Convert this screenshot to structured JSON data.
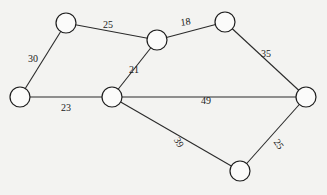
{
  "graph": {
    "type": "weighted-undirected-graph",
    "node_radius": 10,
    "nodes": [
      {
        "id": "A",
        "x": 66,
        "y": 23
      },
      {
        "id": "B",
        "x": 157,
        "y": 40
      },
      {
        "id": "C",
        "x": 225,
        "y": 22
      },
      {
        "id": "D",
        "x": 20,
        "y": 97
      },
      {
        "id": "E",
        "x": 112,
        "y": 97
      },
      {
        "id": "F",
        "x": 306,
        "y": 97
      },
      {
        "id": "G",
        "x": 240,
        "y": 171
      }
    ],
    "edges": [
      {
        "from": "A",
        "to": "B",
        "weight": "25",
        "lx": 108,
        "ly": 28,
        "rot": 0
      },
      {
        "from": "A",
        "to": "D",
        "weight": "30",
        "lx": 33,
        "ly": 62,
        "rot": 0
      },
      {
        "from": "B",
        "to": "C",
        "weight": "18",
        "lx": 186,
        "ly": 25,
        "rot": -8
      },
      {
        "from": "B",
        "to": "E",
        "weight": "21",
        "lx": 134,
        "ly": 73,
        "rot": 0
      },
      {
        "from": "C",
        "to": "F",
        "weight": "35",
        "lx": 266,
        "ly": 57,
        "rot": 0
      },
      {
        "from": "D",
        "to": "E",
        "weight": "23",
        "lx": 66,
        "ly": 111,
        "rot": 0
      },
      {
        "from": "E",
        "to": "F",
        "weight": "49",
        "lx": 206,
        "ly": 104,
        "rot": 0
      },
      {
        "from": "E",
        "to": "G",
        "weight": "39",
        "lx": 176,
        "ly": 144,
        "rot": 60
      },
      {
        "from": "F",
        "to": "G",
        "weight": "25",
        "lx": 276,
        "ly": 146,
        "rot": 55
      }
    ]
  },
  "colors": {
    "background": "#f3f3f1",
    "stroke": "#1e1e1e",
    "node_fill": "#fbfbfa"
  }
}
